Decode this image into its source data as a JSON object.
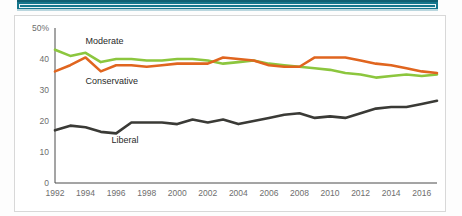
{
  "banner": {
    "name": "top-teal-bar",
    "color": "#15768c"
  },
  "figure": {
    "border_color": "#d8d8d8",
    "background": "#ffffff"
  },
  "chart_data": {
    "type": "line",
    "title": "",
    "subtitle": "",
    "xlabel": "",
    "ylabel": "",
    "grid": false,
    "legend_position": "inline-annotations",
    "xlim": [
      1992,
      2017
    ],
    "ylim": [
      0,
      50
    ],
    "yticks": [
      0,
      10,
      20,
      30,
      40,
      50
    ],
    "ytick_labels": [
      "0",
      "10",
      "20",
      "30",
      "40",
      "50%"
    ],
    "xticks": [
      1992,
      1994,
      1996,
      1998,
      2000,
      2002,
      2004,
      2006,
      2008,
      2010,
      2012,
      2014,
      2016
    ],
    "xtick_labels": [
      "1992",
      "1994",
      "1996",
      "1998",
      "2000",
      "2002",
      "2004",
      "2006",
      "2008",
      "2010",
      "2012",
      "2014",
      "2016"
    ],
    "x": [
      1992,
      1993,
      1994,
      1995,
      1996,
      1997,
      1998,
      1999,
      2000,
      2001,
      2002,
      2003,
      2004,
      2005,
      2006,
      2007,
      2008,
      2009,
      2010,
      2011,
      2012,
      2013,
      2014,
      2015,
      2016,
      2017
    ],
    "series": [
      {
        "name": "Moderate",
        "color": "#8cc63e",
        "label_x": 1994,
        "label_y": 45,
        "values": [
          43,
          41,
          42,
          39,
          40,
          40,
          39.5,
          39.5,
          40,
          40,
          39.5,
          38.5,
          39,
          39.5,
          38.5,
          38,
          37.5,
          37,
          36.5,
          35.5,
          35,
          34,
          34.5,
          35,
          34.5,
          35
        ]
      },
      {
        "name": "Conservative",
        "color": "#e0651f",
        "label_x": 1994,
        "label_y": 32,
        "values": [
          36,
          38,
          40.5,
          36,
          38,
          38,
          37.5,
          38,
          38.5,
          38.5,
          38.5,
          40.5,
          40,
          39.5,
          38,
          37.5,
          37.5,
          40.5,
          40.5,
          40.5,
          39.5,
          38.5,
          38,
          37,
          36,
          35.5
        ]
      },
      {
        "name": "Liberal",
        "color": "#3a3a36",
        "label_x": 1995.7,
        "label_y": 13,
        "values": [
          17,
          18.5,
          18,
          16.5,
          16,
          19.5,
          19.5,
          19.5,
          19,
          20.5,
          19.5,
          20.5,
          19,
          20,
          21,
          22,
          22.5,
          21,
          21.5,
          21,
          22.5,
          24,
          24.5,
          24.5,
          25.5,
          26.5
        ]
      }
    ]
  }
}
